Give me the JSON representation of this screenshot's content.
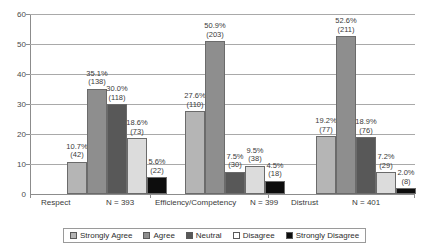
{
  "chart_data": {
    "type": "bar",
    "title": "",
    "xlabel": "",
    "ylabel": "",
    "ylim": [
      0,
      60
    ],
    "yticks": [
      "0",
      "10",
      "20",
      "30",
      "40",
      "50",
      "60"
    ],
    "grid": true,
    "legend_position": "bottom",
    "categories": [
      "Respect",
      "Efficiency/Competency",
      "Distrust"
    ],
    "category_counts": [
      "N = 393",
      "N = 399",
      "N = 401"
    ],
    "series": [
      {
        "name": "Strongly Agree",
        "color": "#b5b5b5",
        "values": [
          10.7,
          27.6,
          19.2
        ],
        "percent_labels": [
          "10.7%",
          "27.6%",
          "19.2%"
        ],
        "count_labels": [
          "(42)",
          "(110)",
          "(77)"
        ]
      },
      {
        "name": "Agree",
        "color": "#8e8e8e",
        "values": [
          35.1,
          50.9,
          52.6
        ],
        "percent_labels": [
          "35.1%",
          "50.9%",
          "52.6%"
        ],
        "count_labels": [
          "(138)",
          "(203)",
          "(211)"
        ]
      },
      {
        "name": "Neutral",
        "color": "#585858",
        "values": [
          30.0,
          7.5,
          18.9
        ],
        "percent_labels": [
          "30.0%",
          "7.5%",
          "18.9%"
        ],
        "count_labels": [
          "(118)",
          "(30)",
          "(76)"
        ]
      },
      {
        "name": "Disagree",
        "color": "#dcdcdc",
        "values": [
          18.6,
          9.5,
          7.2
        ],
        "percent_labels": [
          "18.6%",
          "9.5%",
          "7.2%"
        ],
        "count_labels": [
          "(73)",
          "(38)",
          "(29)"
        ]
      },
      {
        "name": "Strongly Disagree",
        "color": "#0d0d0d",
        "values": [
          5.6,
          4.5,
          2.0
        ],
        "percent_labels": [
          "5.6%",
          "4.5%",
          "2.0%"
        ],
        "count_labels": [
          "(22)",
          "(18)",
          "(8)"
        ]
      }
    ]
  }
}
